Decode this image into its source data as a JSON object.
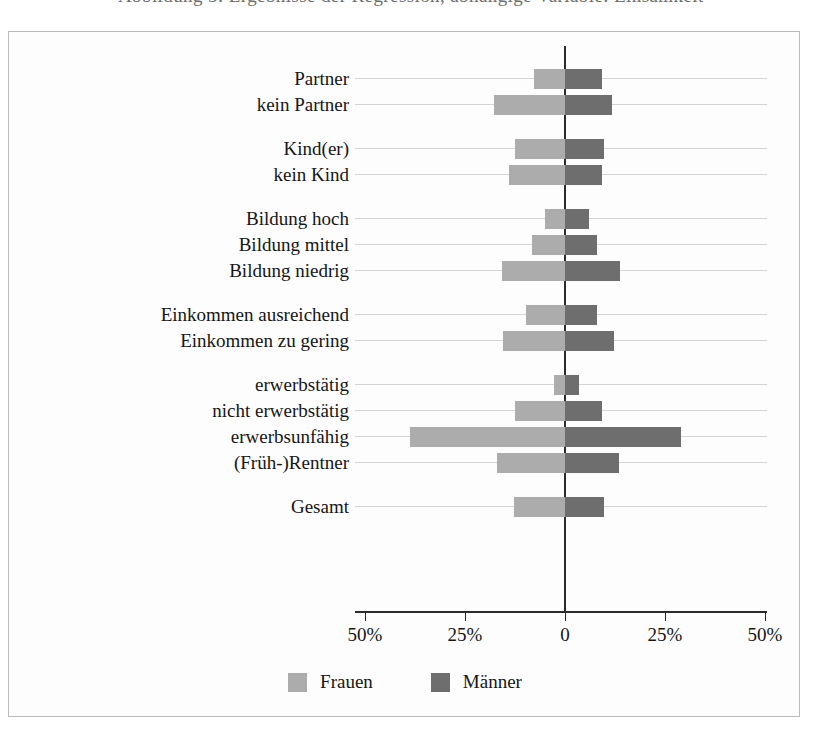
{
  "figure": {
    "top_cut_text": "Abbildung 5: Ergebnisse der Regression, abhängige Variable: Einsamkeit",
    "background": "#ffffff",
    "frame_color": "#b9bdc0"
  },
  "legend": {
    "position": "bottom-center",
    "items": [
      {
        "label": "Frauen",
        "color": "#acacac",
        "swatch_name": "legend-swatch-frauen"
      },
      {
        "label": "Männer",
        "color": "#6e6e6e",
        "swatch_name": "legend-swatch-maenner"
      }
    ]
  },
  "chart_data": {
    "type": "bar",
    "orientation": "horizontal",
    "layout": "diverging-butterfly",
    "title": "",
    "subtitle": "",
    "xlabel": "",
    "ylabel": "",
    "grid": true,
    "legend_position": "bottom-center",
    "xlim": [
      -50,
      50
    ],
    "xticks": [
      -50,
      -25,
      0,
      25,
      50
    ],
    "xtick_labels": [
      "50%",
      "25%",
      "0",
      "25%",
      "50%"
    ],
    "value_unit": "percent",
    "note": "Left side of zero shows Frauen (women), right side shows Männer (men).",
    "categories": [
      "Partner",
      "kein Partner",
      "Kind(er)",
      "kein Kind",
      "Bildung hoch",
      "Bildung mittel",
      "Bildung niedrig",
      "Einkommen ausreichend",
      "Einkommen zu gering",
      "erwerbstätig",
      "nicht erwerbstätig",
      "erwerbsunfähig",
      "(Früh-)Rentner",
      "Gesamt"
    ],
    "group_breaks_after": [
      1,
      3,
      6,
      8,
      12
    ],
    "series": [
      {
        "name": "Frauen",
        "color": "#acacac",
        "side": "left",
        "values": [
          7.8,
          17.8,
          12.5,
          14.0,
          5.0,
          8.3,
          15.8,
          9.8,
          15.5,
          2.8,
          12.5,
          38.7,
          17.0,
          12.8
        ]
      },
      {
        "name": "Männer",
        "color": "#6e6e6e",
        "side": "right",
        "values": [
          9.3,
          11.8,
          9.8,
          9.3,
          6.0,
          8.0,
          13.8,
          8.0,
          12.3,
          3.6,
          9.3,
          29.0,
          13.5,
          9.8
        ]
      }
    ]
  }
}
